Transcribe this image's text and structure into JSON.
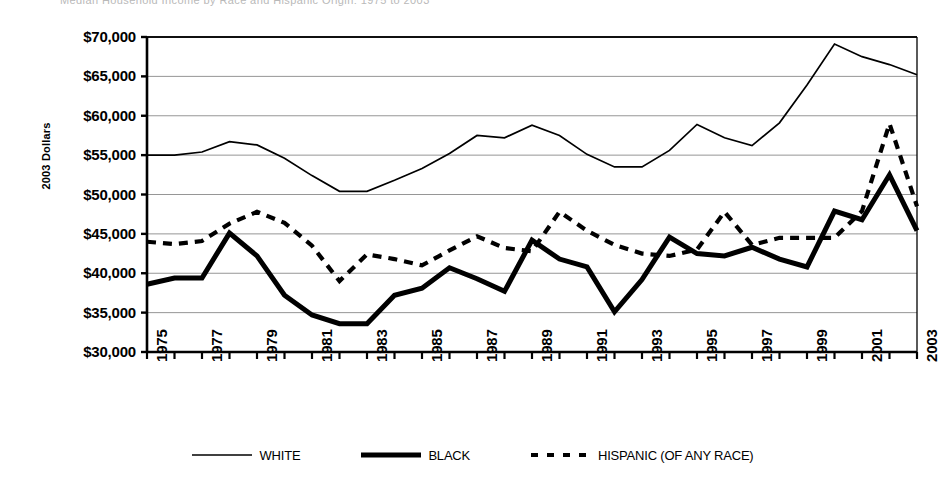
{
  "top_strip_text": "Median Household Income by Race and Hispanic Origin: 1975 to 2003",
  "axis": {
    "ylabel": "2003 Dollars",
    "yticks": [
      "$70,000",
      "$65,000",
      "$60,000",
      "$55,000",
      "$50,000",
      "$45,000",
      "$40,000",
      "$35,000",
      "$30,000"
    ],
    "xticks": [
      "1975",
      "1977",
      "1979",
      "1981",
      "1983",
      "1985",
      "1987",
      "1989",
      "1991",
      "1993",
      "1995",
      "1997",
      "1999",
      "2001",
      "2003"
    ]
  },
  "legend": {
    "items": [
      {
        "label": "WHITE",
        "style": "thin-solid",
        "color": "#000000"
      },
      {
        "label": "BLACK",
        "style": "thick-solid",
        "color": "#000000"
      },
      {
        "label": "HISPANIC (OF ANY RACE)",
        "style": "dashed",
        "color": "#000000"
      }
    ]
  },
  "colors": {
    "line": "#000000",
    "grid": "#8a8a8a",
    "axis": "#000000",
    "background": "#ffffff"
  },
  "chart_data": {
    "type": "line",
    "title": "",
    "xlabel": "",
    "ylabel": "2003 Dollars",
    "xlim": [
      1975,
      2003
    ],
    "ylim": [
      30000,
      70000
    ],
    "ytick_step": 5000,
    "grid": true,
    "legend_position": "bottom",
    "x": [
      1975,
      1976,
      1977,
      1978,
      1979,
      1980,
      1981,
      1982,
      1983,
      1984,
      1985,
      1986,
      1987,
      1988,
      1989,
      1990,
      1991,
      1992,
      1993,
      1994,
      1995,
      1996,
      1997,
      1998,
      1999,
      2000,
      2001,
      2002,
      2003
    ],
    "series": [
      {
        "name": "WHITE",
        "style": "thin-solid",
        "values": [
          55000,
          55000,
          55400,
          56700,
          56300,
          54600,
          52400,
          50400,
          50400,
          51800,
          53300,
          55200,
          57500,
          57200,
          58800,
          57500,
          55100,
          53500,
          53500,
          55600,
          58900,
          57200,
          56200,
          59100,
          63900,
          69100,
          67500,
          66500,
          65200
        ]
      },
      {
        "name": "BLACK",
        "style": "thick-solid",
        "values": [
          38600,
          39400,
          39400,
          45100,
          42200,
          37200,
          34700,
          33600,
          33600,
          37200,
          38100,
          40700,
          39300,
          37700,
          44200,
          41800,
          40800,
          35100,
          39200,
          44600,
          42500,
          42200,
          43300,
          41800,
          40800,
          47900,
          46800,
          52500,
          45400
        ]
      },
      {
        "name": "HISPANIC (OF ANY RACE)",
        "style": "dashed",
        "values": [
          44000,
          43700,
          44100,
          46300,
          47800,
          46400,
          43500,
          39000,
          42400,
          41800,
          41000,
          42900,
          44700,
          43200,
          42800,
          47800,
          45400,
          43600,
          42500,
          42200,
          43000,
          47800,
          43600,
          44500,
          44500,
          44500,
          47900,
          59000,
          48500
        ]
      }
    ],
    "hispanic_detail_note": "dashed series",
    "series_points": {
      "WHITE": [
        {
          "x": 1975,
          "y": 55000
        },
        {
          "x": 1976,
          "y": 55000
        },
        {
          "x": 1977,
          "y": 55400
        },
        {
          "x": 1978,
          "y": 56700
        },
        {
          "x": 1979,
          "y": 56300
        },
        {
          "x": 1980,
          "y": 54600
        },
        {
          "x": 1981,
          "y": 52400
        },
        {
          "x": 1982,
          "y": 50400
        },
        {
          "x": 1983,
          "y": 50400
        },
        {
          "x": 1984,
          "y": 51800
        },
        {
          "x": 1985,
          "y": 53300
        },
        {
          "x": 1986,
          "y": 55200
        },
        {
          "x": 1987,
          "y": 57500
        },
        {
          "x": 1988,
          "y": 57200
        },
        {
          "x": 1989,
          "y": 58800
        },
        {
          "x": 1990,
          "y": 57500
        },
        {
          "x": 1991,
          "y": 55100
        },
        {
          "x": 1992,
          "y": 53500
        },
        {
          "x": 1993,
          "y": 53500
        },
        {
          "x": 1994,
          "y": 55600
        },
        {
          "x": 1995,
          "y": 58900
        },
        {
          "x": 1996,
          "y": 57200
        },
        {
          "x": 1997,
          "y": 56200
        },
        {
          "x": 1998,
          "y": 59100
        },
        {
          "x": 1999,
          "y": 63900
        },
        {
          "x": 2000,
          "y": 69100
        },
        {
          "x": 2001,
          "y": 67500
        },
        {
          "x": 2002,
          "y": 66500
        },
        {
          "x": 2003,
          "y": 65200
        }
      ],
      "BLACK": [
        {
          "x": 1975,
          "y": 38600
        },
        {
          "x": 1976,
          "y": 39400
        },
        {
          "x": 1977,
          "y": 39400
        },
        {
          "x": 1978,
          "y": 45100
        },
        {
          "x": 1979,
          "y": 42200
        },
        {
          "x": 1980,
          "y": 37200
        },
        {
          "x": 1981,
          "y": 34700
        },
        {
          "x": 1982,
          "y": 33600
        },
        {
          "x": 1983,
          "y": 33600
        },
        {
          "x": 1984,
          "y": 37200
        },
        {
          "x": 1985,
          "y": 38100
        },
        {
          "x": 1986,
          "y": 40700
        },
        {
          "x": 1987,
          "y": 39300
        },
        {
          "x": 1988,
          "y": 37700
        },
        {
          "x": 1989,
          "y": 44200
        },
        {
          "x": 1990,
          "y": 41800
        },
        {
          "x": 1991,
          "y": 40800
        },
        {
          "x": 1992,
          "y": 35100
        },
        {
          "x": 1993,
          "y": 39200
        },
        {
          "x": 1994,
          "y": 44600
        },
        {
          "x": 1995,
          "y": 42500
        },
        {
          "x": 1996,
          "y": 42200
        },
        {
          "x": 1997,
          "y": 43300
        },
        {
          "x": 1998,
          "y": 41800
        },
        {
          "x": 1999,
          "y": 40800
        },
        {
          "x": 2000,
          "y": 47900
        },
        {
          "x": 2001,
          "y": 46800
        },
        {
          "x": 2002,
          "y": 52500
        },
        {
          "x": 2003,
          "y": 45400
        }
      ],
      "HISPANIC (OF ANY RACE)": [
        {
          "x": 1975,
          "y": 44000
        },
        {
          "x": 1976,
          "y": 43700
        },
        {
          "x": 1977,
          "y": 44100
        },
        {
          "x": 1978,
          "y": 46300
        },
        {
          "x": 1979,
          "y": 47800
        },
        {
          "x": 1980,
          "y": 46400
        },
        {
          "x": 1981,
          "y": 43500
        },
        {
          "x": 1982,
          "y": 39000
        },
        {
          "x": 1983,
          "y": 42400
        },
        {
          "x": 1984,
          "y": 41800
        },
        {
          "x": 1985,
          "y": 41000
        },
        {
          "x": 1986,
          "y": 42900
        },
        {
          "x": 1987,
          "y": 44700
        },
        {
          "x": 1988,
          "y": 43200
        },
        {
          "x": 1989,
          "y": 42800
        },
        {
          "x": 1990,
          "y": 47800
        },
        {
          "x": 1991,
          "y": 45400
        },
        {
          "x": 1992,
          "y": 43600
        },
        {
          "x": 1993,
          "y": 42500
        },
        {
          "x": 1994,
          "y": 42200
        },
        {
          "x": 1995,
          "y": 43000
        },
        {
          "x": 1996,
          "y": 47800
        },
        {
          "x": 1997,
          "y": 43600
        },
        {
          "x": 1998,
          "y": 44500
        },
        {
          "x": 1999,
          "y": 44500
        },
        {
          "x": 2000,
          "y": 44500
        },
        {
          "x": 2001,
          "y": 47900
        },
        {
          "x": 2002,
          "y": 59000
        },
        {
          "x": 2003,
          "y": 48500
        }
      ]
    }
  }
}
